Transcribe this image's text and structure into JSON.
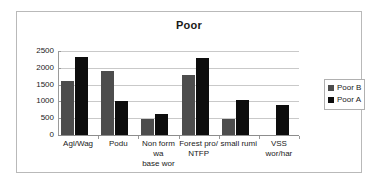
{
  "chart_data": {
    "type": "bar",
    "title": "Poor",
    "xlabel": "",
    "ylabel": "",
    "ylim": [
      0,
      2500
    ],
    "yticks": [
      "0",
      "500",
      "1000",
      "1500",
      "2000",
      "2500"
    ],
    "grid": true,
    "legend_position": "right",
    "categories": [
      "Agl/Wag",
      "Podu",
      "Non form\nwa\nbase wor",
      "Forest pro/\nNTFP",
      "small rumi",
      "VSS\nwor/har"
    ],
    "series": [
      {
        "name": "Poor B",
        "color": "#4d4d4d",
        "values": [
          1620,
          1920,
          470,
          1780,
          480,
          0
        ]
      },
      {
        "name": "Poor A",
        "color": "#0d0d0d",
        "values": [
          2330,
          1000,
          620,
          2300,
          1030,
          880
        ]
      }
    ]
  },
  "legend": {
    "items": [
      {
        "label": "Poor B",
        "color": "#4d4d4d"
      },
      {
        "label": "Poor A",
        "color": "#0d0d0d"
      }
    ]
  }
}
